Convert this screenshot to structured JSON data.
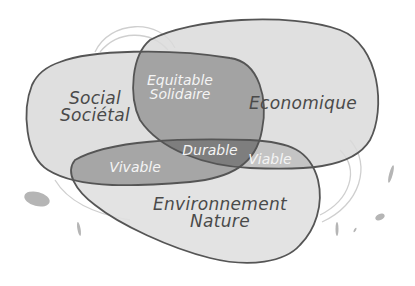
{
  "diagram": {
    "title": "",
    "type": "venn",
    "sets": [
      {
        "id": "social",
        "label_line1": "Social",
        "label_line2": "Sociétal",
        "fill": "#d4d4d4"
      },
      {
        "id": "economique",
        "label": "Economique",
        "fill": "#d6d6d6"
      },
      {
        "id": "environnement",
        "label_line1": "Environnement",
        "label_line2": "Nature",
        "fill": "#dcdcdc"
      }
    ],
    "intersections": [
      {
        "sets": [
          "social",
          "economique"
        ],
        "label_line1": "Equitable",
        "label_line2": "Solidaire",
        "fill": "#9a9a9a"
      },
      {
        "sets": [
          "social",
          "environnement"
        ],
        "label": "Vivable",
        "fill": "#9e9e9e"
      },
      {
        "sets": [
          "economique",
          "environnement"
        ],
        "label": "Viable",
        "fill": "#b8b8b8"
      },
      {
        "sets": [
          "social",
          "economique",
          "environnement"
        ],
        "label": "Durable",
        "fill": "#7a7a7a"
      }
    ],
    "colors": {
      "outline": "#555555",
      "background": "#ffffff",
      "text_dark": "#4a4a4a",
      "text_light": "#f4f4f4"
    }
  }
}
